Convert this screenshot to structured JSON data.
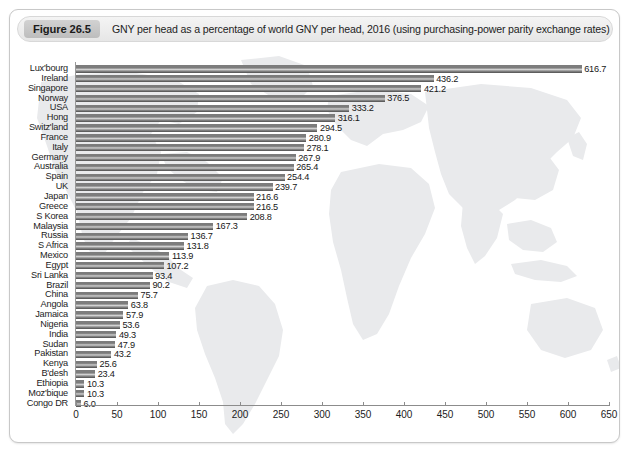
{
  "figure": {
    "badge": "Figure 26.5",
    "title": "GNY per head as a percentage of world GNY per head, 2016 (using purchasing-power parity exchange rates)"
  },
  "chart_data": {
    "type": "bar",
    "orientation": "horizontal",
    "title": "GNY per head as a percentage of world GNY per head, 2016 (using purchasing-power parity exchange rates)",
    "xlabel": "",
    "ylabel": "",
    "xlim": [
      0,
      650
    ],
    "xticks": [
      0,
      50,
      100,
      150,
      200,
      250,
      300,
      350,
      400,
      450,
      500,
      550,
      600,
      650
    ],
    "grid": false,
    "legend": null,
    "background": "faint-world-map",
    "bar_color": "#7a7a7a",
    "categories": [
      "Lux'bourg",
      "Ireland",
      "Singapore",
      "Norway",
      "USA",
      "Hong",
      "Switz'land",
      "France",
      "Italy",
      "Germany",
      "Australia",
      "Spain",
      "UK",
      "Japan",
      "Greece",
      "S Korea",
      "Malaysia",
      "Russia",
      "S Africa",
      "Mexico",
      "Egypt",
      "Sri Lanka",
      "Brazil",
      "China",
      "Angola",
      "Jamaica",
      "Nigeria",
      "India",
      "Sudan",
      "Pakistan",
      "Kenya",
      "B'desh",
      "Ethiopia",
      "Moz'bique",
      "Congo DR"
    ],
    "values": [
      616.7,
      436.2,
      421.2,
      376.5,
      333.2,
      316.1,
      294.5,
      280.9,
      278.1,
      267.9,
      265.4,
      254.4,
      239.7,
      216.6,
      216.5,
      208.8,
      167.3,
      136.7,
      131.8,
      113.9,
      107.2,
      93.4,
      90.2,
      75.7,
      63.8,
      57.9,
      53.6,
      49.3,
      47.9,
      43.2,
      25.6,
      23.4,
      10.3,
      10.3,
      6.0
    ],
    "value_labels": [
      "616.7",
      "436.2",
      "421.2",
      "376.5",
      "333.2",
      "316.1",
      "294.5",
      "280.9",
      "278.1",
      "267.9",
      "265.4",
      "254.4",
      "239.7",
      "216.6",
      "216.5",
      "208.8",
      "167.3",
      "136.7",
      "131.8",
      "113.9",
      "107.2",
      "93.4",
      "90.2",
      "75.7",
      "63.8",
      "57.9",
      "53.6",
      "49.3",
      "47.9",
      "43.2",
      "25.6",
      "23.4",
      "10.3",
      "10.3",
      "6.0"
    ]
  }
}
